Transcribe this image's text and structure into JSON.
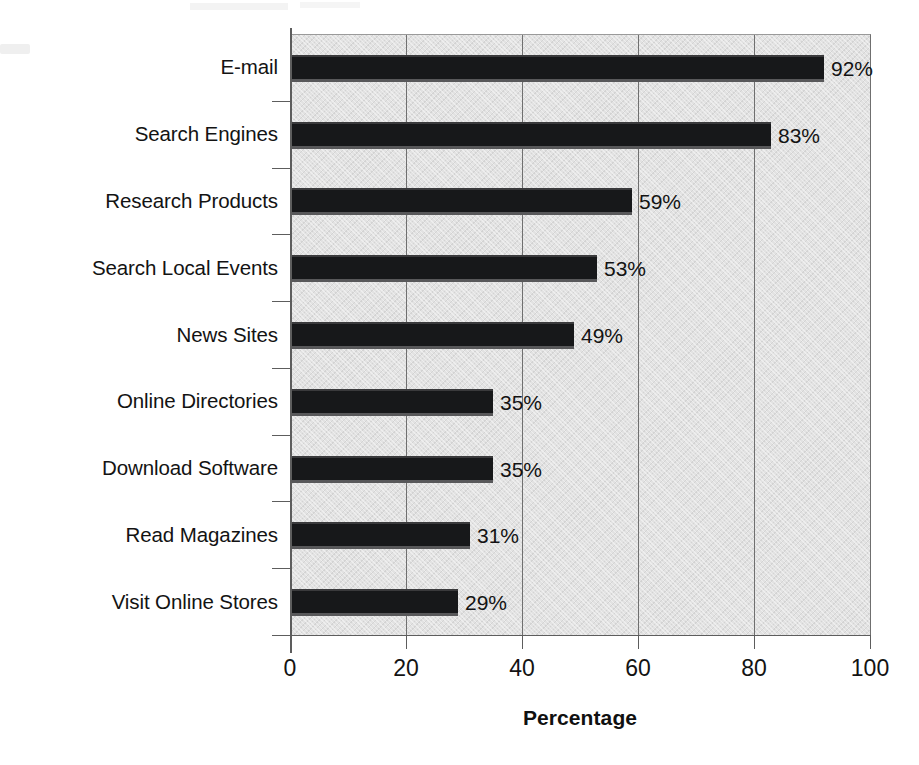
{
  "chart_data": {
    "type": "bar",
    "orientation": "horizontal",
    "title": "",
    "xlabel": "Percentage",
    "ylabel": "",
    "xlim": [
      0,
      100
    ],
    "xticks": [
      0,
      20,
      40,
      60,
      80,
      100
    ],
    "xtick_labels": [
      "0",
      "20",
      "40",
      "60",
      "80",
      "100"
    ],
    "grid": "vertical",
    "legend": "none",
    "categories": [
      "E-mail",
      "Search Engines",
      "Research Products",
      "Search Local Events",
      "News Sites",
      "Online Directories",
      "Download Software",
      "Read Magazines",
      "Visit Online Stores"
    ],
    "values": [
      92,
      83,
      59,
      53,
      49,
      35,
      35,
      31,
      29
    ],
    "data_labels": [
      "92%",
      "83%",
      "59%",
      "53%",
      "49%",
      "35%",
      "35%",
      "31%",
      "29%"
    ],
    "series": [
      {
        "name": "Percentage",
        "values": [
          92,
          83,
          59,
          53,
          49,
          35,
          35,
          31,
          29
        ]
      }
    ],
    "colors": {
      "bar": "#17181a",
      "plot_background": "#e2e2e2",
      "gridline": "#6f6f6f",
      "axis": "#5d5d5d",
      "text": "#131313",
      "page_background": "#ffffff"
    }
  }
}
